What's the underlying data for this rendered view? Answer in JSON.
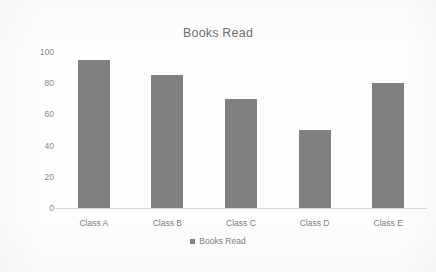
{
  "chart_data": {
    "type": "bar",
    "title": "Books Read",
    "categories": [
      "Class A",
      "Class B",
      "Class C",
      "Class D",
      "Class E"
    ],
    "values": [
      95,
      85,
      70,
      50,
      80
    ],
    "series": [
      {
        "name": "Books Read",
        "values": [
          95,
          85,
          70,
          50,
          80
        ]
      }
    ],
    "xlabel": "",
    "ylabel": "",
    "ylim": [
      0,
      100
    ],
    "yticks": [
      0,
      20,
      40,
      60,
      80,
      100
    ],
    "ytick_labels": [
      "0",
      "20",
      "40",
      "60",
      "80",
      "100"
    ],
    "grid": false,
    "legend": {
      "position": "bottom",
      "entries": [
        "Books Read"
      ]
    },
    "colors": {
      "bar": "#808080",
      "background": "#fdfdfd",
      "text": "#7e7e7e",
      "title_text": "#707070",
      "axis_line": "#d8d8d8"
    }
  }
}
